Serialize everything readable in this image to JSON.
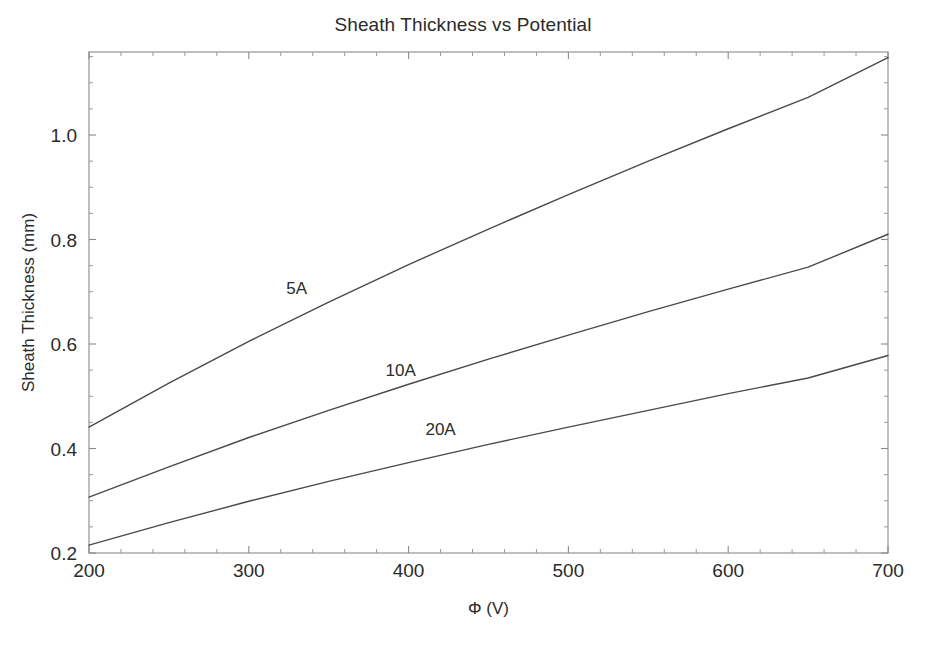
{
  "chart_data": {
    "type": "line",
    "title": "Sheath Thickness vs Potential",
    "xlabel": "Φ (V)",
    "ylabel": "Sheath Thickness (mm)",
    "xlim": [
      200,
      700
    ],
    "ylim": [
      0.2,
      1.15
    ],
    "grid": false,
    "legend_position": "inline-annotations",
    "x_ticks": [
      200,
      300,
      400,
      500,
      600,
      700
    ],
    "x_tick_labels": [
      "200",
      "300",
      "400",
      "500",
      "600",
      "700"
    ],
    "x_minor_tick_step": 20,
    "y_ticks": [
      0.2,
      0.4,
      0.6,
      0.8,
      1.0
    ],
    "y_tick_labels": [
      "0.2",
      "0.4",
      "0.6",
      "0.8",
      "1.0"
    ],
    "y_minor_tick_step": 0.05,
    "x": [
      200,
      250,
      300,
      350,
      400,
      450,
      500,
      550,
      600,
      650,
      700
    ],
    "series": [
      {
        "name": "5A",
        "label": "5A",
        "color": "#4a4a4a",
        "label_x": 330,
        "label_y": 0.695,
        "values": [
          0.441,
          0.525,
          0.605,
          0.68,
          0.752,
          0.82,
          0.886,
          0.95,
          1.012,
          1.072,
          1.148
        ]
      },
      {
        "name": "10A",
        "label": "10A",
        "color": "#4a4a4a",
        "label_x": 395,
        "label_y": 0.538,
        "values": [
          0.307,
          0.365,
          0.421,
          0.473,
          0.523,
          0.571,
          0.617,
          0.662,
          0.705,
          0.747,
          0.81
        ]
      },
      {
        "name": "20A",
        "label": "20A",
        "color": "#4a4a4a",
        "label_x": 420,
        "label_y": 0.425,
        "values": [
          0.215,
          0.258,
          0.299,
          0.337,
          0.373,
          0.408,
          0.441,
          0.473,
          0.505,
          0.535,
          0.578
        ]
      }
    ]
  },
  "colors": {
    "background": "#ffffff",
    "axis": "#8a8a8a",
    "text": "#2b2b2b",
    "curve": "#4a4a4a"
  }
}
